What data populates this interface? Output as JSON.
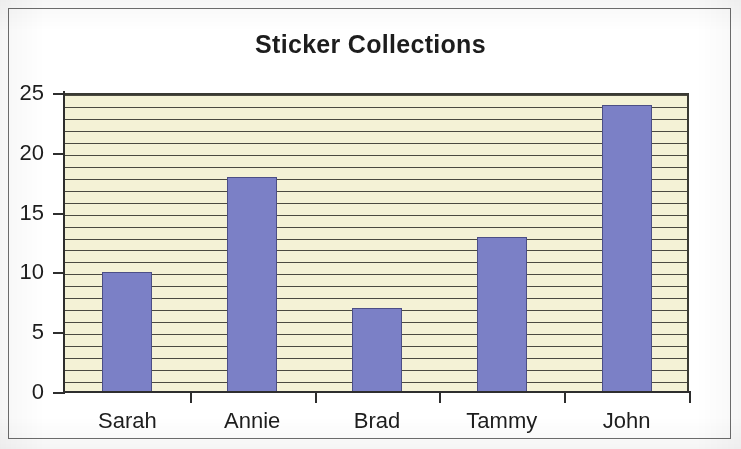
{
  "chart_data": {
    "type": "bar",
    "title": "Sticker Collections",
    "categories": [
      "Sarah",
      "Annie",
      "Brad",
      "Tammy",
      "John"
    ],
    "values": [
      10,
      18,
      7,
      13,
      24
    ],
    "series": [
      {
        "name": "Stickers",
        "values": [
          10,
          18,
          7,
          13,
          24
        ]
      }
    ],
    "xlabel": "",
    "ylabel": "",
    "ylim": [
      0,
      25
    ],
    "y_ticks": [
      0,
      5,
      10,
      15,
      20,
      25
    ],
    "y_tick_labels": [
      "0",
      "5",
      "10",
      "15",
      "20",
      "25"
    ],
    "y_gridline_interval": 1,
    "grid": true,
    "legend": false,
    "legend_position": "none",
    "colors": {
      "bar_fill": "#7b80c6",
      "bar_border": "#4c4f86",
      "plot_background": "#f4f2d6",
      "gridline": "#4b4a40",
      "axis": "#2e2e2e",
      "text": "#1d1d1d",
      "frame_border": "#6d6d6d",
      "page_background": "#ffffff"
    }
  }
}
